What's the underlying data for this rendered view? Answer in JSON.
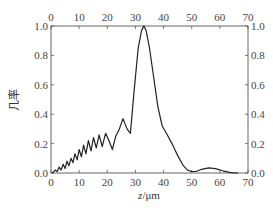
{
  "chart_data": {
    "type": "line",
    "title": "",
    "xlabel": "z/μm",
    "xlabel_italic_part": "z",
    "xlabel_unit_part": "/μm",
    "ylabel": "几率",
    "xlim": [
      0,
      70
    ],
    "ylim": [
      0,
      1.0
    ],
    "x_ticks": [
      0,
      10,
      20,
      30,
      40,
      50,
      60,
      70
    ],
    "y_ticks": [
      0.0,
      0.2,
      0.4,
      0.6,
      0.8,
      1.0
    ],
    "x_tick_labels": [
      "0",
      "10",
      "20",
      "30",
      "40",
      "50",
      "60",
      "70"
    ],
    "y_tick_labels": [
      "0.0",
      "0.2",
      "0.4",
      "0.6",
      "0.8",
      "1.0"
    ],
    "mirrored_axes": {
      "top_x": true,
      "right_y": true
    },
    "grid": false,
    "legend": null,
    "series": [
      {
        "name": "probability",
        "color": "#222222",
        "x": [
          0.5,
          1.5,
          2.2,
          2.9,
          3.6,
          4.3,
          5.0,
          5.7,
          6.4,
          7.1,
          7.8,
          8.5,
          9.3,
          10.0,
          10.8,
          11.6,
          12.4,
          13.3,
          14.2,
          15.1,
          16.1,
          17.1,
          18.2,
          19.4,
          20.6,
          21.8,
          23.0,
          24.3,
          25.6,
          27.0,
          28.2,
          29.5,
          31.0,
          32.2,
          33.0,
          33.8,
          35.0,
          36.5,
          38.0,
          39.5,
          41.0,
          43.0,
          45.0,
          47.0,
          48.5,
          50.0,
          51.5,
          53.5,
          56.0,
          58.5,
          61.0,
          63.5,
          65.5,
          66.5
        ],
        "y": [
          0.0,
          0.02,
          0.01,
          0.04,
          0.02,
          0.06,
          0.03,
          0.08,
          0.05,
          0.1,
          0.07,
          0.13,
          0.09,
          0.16,
          0.11,
          0.19,
          0.13,
          0.22,
          0.15,
          0.24,
          0.17,
          0.26,
          0.18,
          0.27,
          0.22,
          0.16,
          0.25,
          0.3,
          0.37,
          0.3,
          0.27,
          0.55,
          0.85,
          0.97,
          1.0,
          0.97,
          0.85,
          0.65,
          0.45,
          0.32,
          0.27,
          0.2,
          0.12,
          0.05,
          0.02,
          0.01,
          0.01,
          0.025,
          0.035,
          0.03,
          0.015,
          0.005,
          0.0,
          0.0
        ]
      }
    ]
  }
}
